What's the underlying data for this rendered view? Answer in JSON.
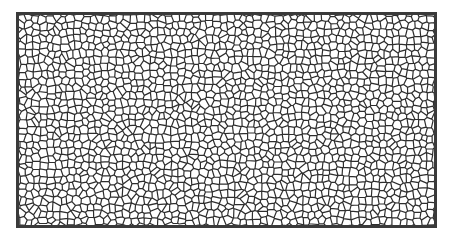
{
  "image": {
    "description": "Voronoi cell (crackle) pattern in a dark rectangular frame",
    "colors": {
      "background": "#ffffff",
      "lines": "#2e2e2e",
      "frame": "#3a3a3a"
    },
    "pattern": {
      "cells_x": 60,
      "cells_y": 30,
      "seed": 7
    }
  }
}
